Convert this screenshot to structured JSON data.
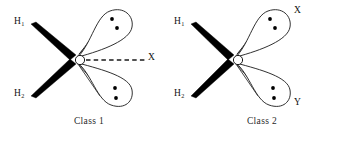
{
  "figure": {
    "background_color": "#ffffff",
    "line_color": "#1a1a1a",
    "wedge_color": "#000000",
    "dot_color": "#000000"
  },
  "panels": [
    {
      "id": "class-1",
      "caption": "Class 1",
      "center_atom": "O",
      "bonds": [
        {
          "label": "H",
          "subscript": "1",
          "style": "wedge",
          "position": "upper-left"
        },
        {
          "label": "H",
          "subscript": "2",
          "style": "wedge",
          "position": "lower-left"
        }
      ],
      "dashed_bonds": [
        {
          "label": "X",
          "style": "dashed",
          "position": "right"
        }
      ],
      "lone_pairs": [
        {
          "position": "upper-right",
          "dots": 2,
          "label": ""
        },
        {
          "position": "lower-right",
          "dots": 2,
          "label": ""
        }
      ]
    },
    {
      "id": "class-2",
      "caption": "Class 2",
      "center_atom": "O",
      "bonds": [
        {
          "label": "H",
          "subscript": "1",
          "style": "wedge",
          "position": "upper-left"
        },
        {
          "label": "H",
          "subscript": "2",
          "style": "wedge",
          "position": "lower-left"
        }
      ],
      "dashed_bonds": [],
      "lone_pairs": [
        {
          "position": "upper-right",
          "dots": 2,
          "label": "X"
        },
        {
          "position": "lower-right",
          "dots": 2,
          "label": "Y"
        }
      ]
    }
  ]
}
